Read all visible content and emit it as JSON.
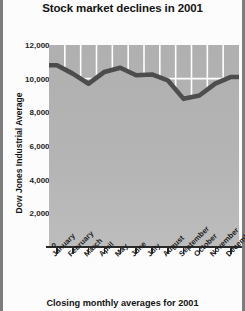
{
  "chart_data": {
    "type": "area",
    "title": "Stock market declines in 2001",
    "xlabel": "Closing monthly averages for 2001",
    "ylabel": "Dow Jones Industrial Average",
    "categories": [
      "January",
      "February",
      "March",
      "April",
      "May",
      "June",
      "July",
      "August",
      "September",
      "October",
      "November",
      "December"
    ],
    "values": [
      10800,
      10300,
      9700,
      10400,
      10650,
      10200,
      10250,
      9900,
      8800,
      9000,
      9700,
      10100
    ],
    "series": [
      {
        "name": "Dow Jones Industrial Average",
        "values": [
          10800,
          10300,
          9700,
          10400,
          10650,
          10200,
          10250,
          9900,
          8800,
          9000,
          9700,
          10100
        ]
      }
    ],
    "ylim": [
      0,
      12000
    ],
    "ytick_values": [
      0,
      2000,
      4000,
      6000,
      8000,
      10000,
      12000
    ],
    "ytick_labels": [
      "0",
      "2,000",
      "4,000",
      "6,000",
      "8,000",
      "10,000",
      "12,000"
    ],
    "grid": true,
    "grid_color": "#ffffff",
    "legend": "none",
    "plot_background": "#b0b0b0",
    "line_color": "#4a4a4a",
    "area_fill": "#b0b0b0"
  },
  "axis": {
    "y_title": "Dow Jones Industrial Average",
    "tick_dash": "–",
    "zero_label": "0"
  },
  "caption": {
    "bottom": "Closing monthly averages for 2001"
  }
}
